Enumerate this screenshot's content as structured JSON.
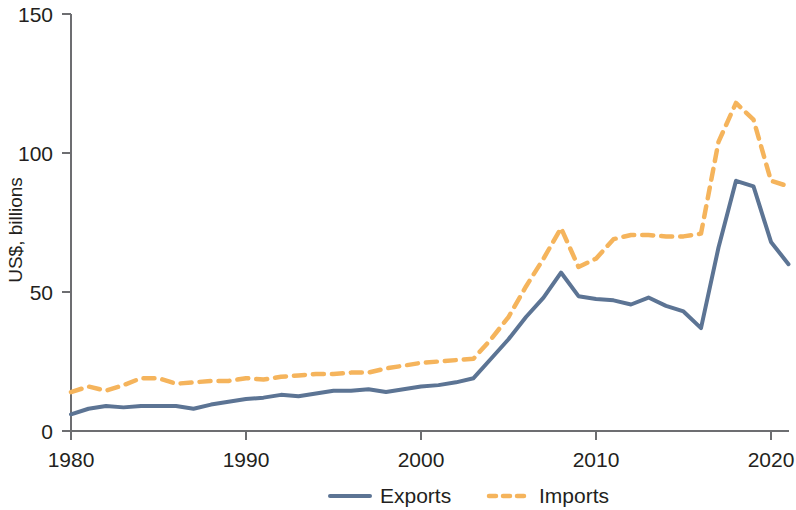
{
  "chart_data": {
    "type": "line",
    "title": "",
    "subtitle": "",
    "xlabel": "",
    "ylabel": "US$, billions",
    "xlim": [
      1980,
      2021
    ],
    "ylim": [
      0,
      150
    ],
    "grid": false,
    "legend_position": "bottom-center",
    "x_ticks": [
      "1980",
      "1990",
      "2000",
      "2010",
      "2020"
    ],
    "x_tick_values": [
      1980,
      1990,
      2000,
      2010,
      2020
    ],
    "y_ticks": [
      "0",
      "50",
      "100",
      "150"
    ],
    "y_tick_values": [
      0,
      50,
      100,
      150
    ],
    "x": [
      1980,
      1981,
      1982,
      1983,
      1984,
      1985,
      1986,
      1987,
      1988,
      1989,
      1990,
      1991,
      1992,
      1993,
      1994,
      1995,
      1996,
      1997,
      1998,
      1999,
      2000,
      2001,
      2002,
      2003,
      2004,
      2005,
      2006,
      2007,
      2008,
      2009,
      2010,
      2011,
      2012,
      2013,
      2014,
      2015,
      2016,
      2017,
      2018,
      2019,
      2020,
      2021
    ],
    "series": [
      {
        "name": "Exports",
        "color": "#5c7494",
        "style": "solid",
        "values": [
          6,
          8,
          9,
          8.5,
          9,
          9,
          9,
          8,
          9.5,
          10.5,
          11.5,
          12,
          13,
          12.5,
          13.5,
          14.5,
          14.5,
          15,
          14,
          15,
          16,
          16.5,
          17.5,
          19,
          26,
          33,
          41,
          48,
          57,
          48.5,
          47.5,
          47,
          45.5,
          48,
          45,
          43,
          37,
          66,
          90,
          88,
          68,
          60
        ]
      },
      {
        "name": "Imports",
        "color": "#f5b45c",
        "style": "dashed",
        "values": [
          14,
          16,
          14.5,
          16.5,
          19,
          19,
          17,
          17.5,
          18,
          18,
          19,
          18.5,
          19.5,
          20,
          20.5,
          20.5,
          21,
          21,
          22.5,
          23.5,
          24.5,
          25,
          25.5,
          26,
          33,
          41,
          52,
          62,
          73,
          59,
          62,
          69,
          70.5,
          70.5,
          70,
          70,
          71,
          104,
          118,
          112,
          90,
          88
        ]
      }
    ],
    "legend": [
      {
        "label": "Exports",
        "color": "#5c7494",
        "style": "solid"
      },
      {
        "label": "Imports",
        "color": "#f5b45c",
        "style": "dashed"
      }
    ]
  }
}
